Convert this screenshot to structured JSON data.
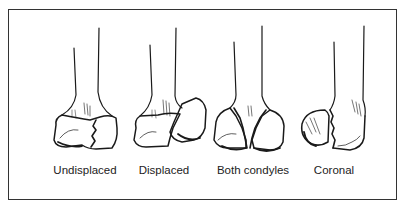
{
  "figure": {
    "panels": [
      {
        "id": "undisplaced",
        "label": "Undisplaced"
      },
      {
        "id": "displaced",
        "label": "Displaced"
      },
      {
        "id": "both-condyles",
        "label": "Both condyles"
      },
      {
        "id": "coronal",
        "label": "Coronal"
      }
    ],
    "colors": {
      "ink": "#1a1a1a",
      "frame": "#333333",
      "background": "#ffffff"
    }
  }
}
